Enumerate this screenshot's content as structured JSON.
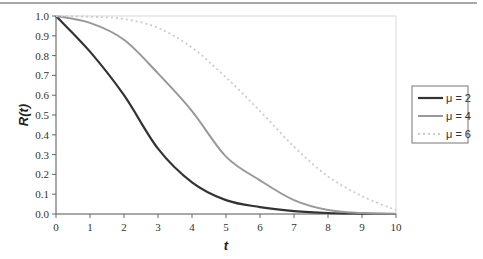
{
  "chart_data": {
    "type": "line",
    "title": "",
    "xlabel": "t",
    "ylabel": "R(t)",
    "xlim": [
      0,
      10
    ],
    "ylim": [
      0,
      1.0
    ],
    "xticks": [
      "0",
      "1",
      "2",
      "3",
      "4",
      "5",
      "6",
      "7",
      "8",
      "9",
      "10"
    ],
    "yticks": [
      "0.0",
      "0.1",
      "0.2",
      "0.3",
      "0.4",
      "0.5",
      "0.6",
      "0.7",
      "0.8",
      "0.9",
      "1.0"
    ],
    "grid": false,
    "legend_position": "right",
    "x": [
      0,
      1,
      2,
      3,
      4,
      5,
      6,
      7,
      8,
      9,
      10
    ],
    "series": [
      {
        "name": "μ = 2",
        "color": "#333333",
        "style": "solid",
        "width": 2.2,
        "values": [
          1.0,
          0.82,
          0.6,
          0.33,
          0.16,
          0.07,
          0.035,
          0.015,
          0.005,
          0.002,
          0.0
        ]
      },
      {
        "name": "μ = 4",
        "color": "#999999",
        "style": "solid",
        "width": 2.0,
        "values": [
          1.0,
          0.965,
          0.88,
          0.71,
          0.52,
          0.29,
          0.17,
          0.07,
          0.02,
          0.005,
          0.001
        ]
      },
      {
        "name": "μ = 6",
        "color": "#cccccc",
        "style": "dotted",
        "width": 1.8,
        "values": [
          1.0,
          0.996,
          0.985,
          0.94,
          0.84,
          0.69,
          0.52,
          0.34,
          0.19,
          0.09,
          0.02
        ]
      }
    ]
  },
  "legend": {
    "items": [
      {
        "label": "μ = 2"
      },
      {
        "label": "μ = 4"
      },
      {
        "label": "μ = 6"
      }
    ]
  },
  "axes": {
    "x_title": "t",
    "y_title": "R(t)"
  }
}
